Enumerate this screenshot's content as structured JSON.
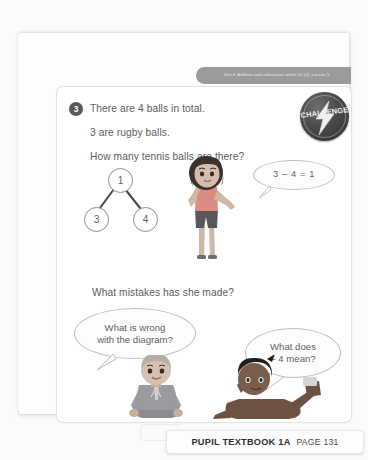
{
  "page": {
    "unit_banner": "Unit 4: Addition and subtraction within 10 (2), Lesson 5",
    "question_number": "3",
    "challenge_label": "CHALLENGE",
    "lines": {
      "l1": "There are 4 balls in total.",
      "l2": "3 are rugby balls.",
      "l3": "How many tennis balls are there?",
      "l4": "What mistakes has she made?"
    },
    "part_whole": {
      "whole": "1",
      "part_a": "3",
      "part_b": "4"
    },
    "bubbles": {
      "equation": "3 – 4 = 1",
      "left": "What is wrong\nwith the diagram?",
      "right": "What does\n– 4 mean?"
    },
    "footer": {
      "practice_link": "→ Practice book 1A p93",
      "page_marker": "[3]",
      "book_title": "PUPIL TEXTBOOK 1A",
      "page_label": "PAGE 131"
    },
    "colors": {
      "badge_dark": "#585858",
      "banner_grey": "#9b9b9b",
      "text_grey": "#5b5b5b",
      "tab_dark": "#4e4e4e"
    }
  }
}
